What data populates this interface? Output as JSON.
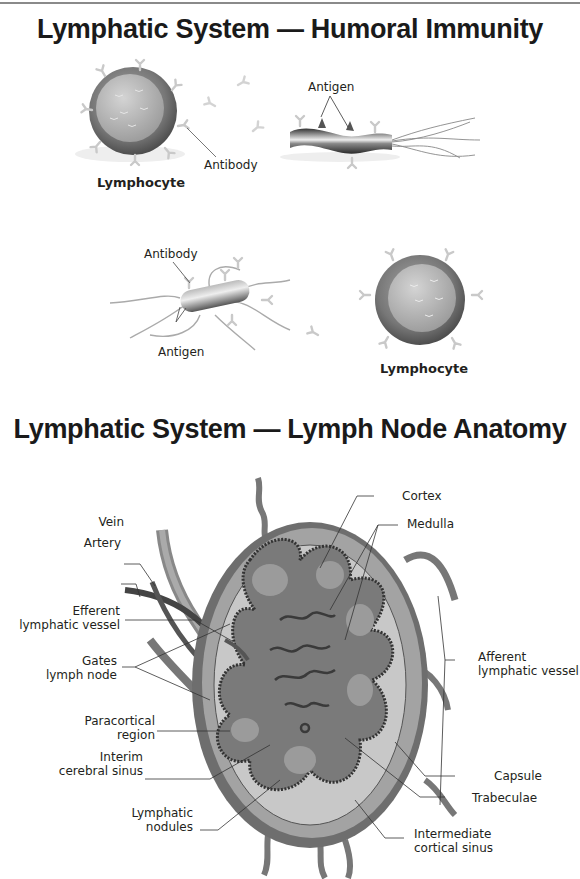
{
  "humoral_immunity": {
    "title": "Lymphatic System — Humoral Immunity",
    "panel_top": {
      "lymphocyte_label": "Lymphocyte",
      "antibody_label": "Antibody",
      "antigen_label": "Antigen"
    },
    "panel_bottom": {
      "antibody_label": "Antibody",
      "antigen_label": "Antigen",
      "lymphocyte_label": "Lymphocyte"
    }
  },
  "lymph_node": {
    "title": "Lymphatic System — Lymph Node Anatomy",
    "left_labels": [
      {
        "text": "Vein"
      },
      {
        "text": "Artery"
      },
      {
        "line1": "Efferent",
        "line2": "lymphatic vessel"
      },
      {
        "line1": "Gates",
        "line2": "lymph node"
      },
      {
        "line1": "Paracortical",
        "line2": "region"
      },
      {
        "line1": "Interim",
        "line2": "cerebral sinus"
      },
      {
        "line1": "Lymphatic",
        "line2": "nodules"
      }
    ],
    "right_labels": [
      {
        "text": "Cortex"
      },
      {
        "text": "Medulla"
      },
      {
        "line1": "Afferent",
        "line2": "lymphatic vessel"
      },
      {
        "text": "Capsule"
      },
      {
        "text": "Trabeculae"
      },
      {
        "line1": "Intermediate",
        "line2": "cortical sinus"
      }
    ]
  }
}
